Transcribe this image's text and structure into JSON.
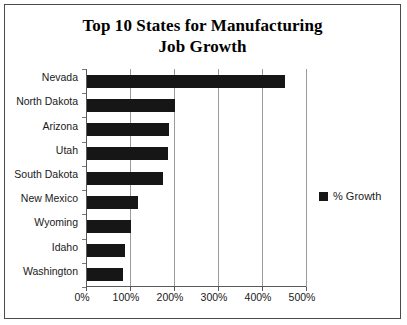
{
  "chart_data": {
    "type": "bar",
    "orientation": "horizontal",
    "title": "Top 10 States for Manufacturing Job Growth",
    "title_line1": "Top 10 States for Manufacturing",
    "title_line2": "Job Growth",
    "xlabel": "",
    "ylabel": "",
    "categories": [
      "Nevada",
      "North Dakota",
      "Arizona",
      "Utah",
      "South Dakota",
      "New Mexico",
      "Wyoming",
      "Idaho",
      "Washington"
    ],
    "values": [
      450,
      200,
      187,
      185,
      172,
      115,
      100,
      87,
      81
    ],
    "value_unit": "%",
    "series": [
      {
        "name": "% Growth",
        "color": "#161616",
        "values": [
          450,
          200,
          187,
          185,
          172,
          115,
          100,
          87,
          81
        ]
      }
    ],
    "xlim": [
      0,
      500
    ],
    "xticks": [
      0,
      100,
      200,
      300,
      400,
      500
    ],
    "xtick_labels": [
      "0%",
      "100%",
      "200%",
      "300%",
      "400%",
      "500%"
    ],
    "grid": "vertical",
    "legend": {
      "position": "right",
      "entries": [
        {
          "label": "% Growth",
          "color": "#161616",
          "marker": "square"
        }
      ]
    },
    "colors": {
      "bar": "#161616",
      "grid": "#9a9a9a",
      "axis": "#5a5a5a",
      "text": "#1a1a1a",
      "background": "#ffffff",
      "frame": "#4a4a4a"
    }
  }
}
